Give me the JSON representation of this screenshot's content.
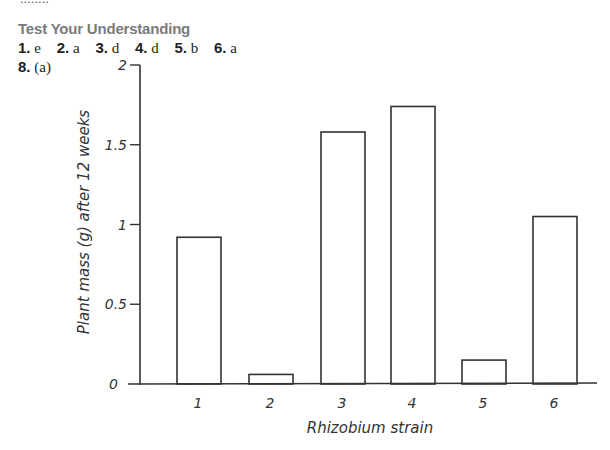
{
  "header": {
    "cutoff_text": "........",
    "section_title": "Test Your Understanding",
    "answers": [
      {
        "num": "1.",
        "ans": "e"
      },
      {
        "num": "2.",
        "ans": "a"
      },
      {
        "num": "3.",
        "ans": "d"
      },
      {
        "num": "4.",
        "ans": "d"
      },
      {
        "num": "5.",
        "ans": "b"
      },
      {
        "num": "6.",
        "ans": "a"
      }
    ],
    "q8": {
      "num": "8.",
      "part": "(a)"
    }
  },
  "chart_data": {
    "type": "bar",
    "title": "",
    "xlabel": "Rhizobium strain",
    "ylabel": "Plant mass (g) after 12 weeks",
    "categories": [
      "1",
      "2",
      "3",
      "4",
      "5",
      "6"
    ],
    "values": [
      0.92,
      0.06,
      1.58,
      1.74,
      0.15,
      1.05
    ],
    "ylim": [
      0,
      2
    ],
    "yticks": [
      0,
      0.5,
      1,
      1.5,
      2
    ],
    "ytick_labels": [
      "0",
      "0.5",
      "1",
      "1.5",
      "2"
    ],
    "grid": false,
    "legend": null,
    "bar_fill": "#ffffff",
    "bar_stroke": "#333333"
  }
}
